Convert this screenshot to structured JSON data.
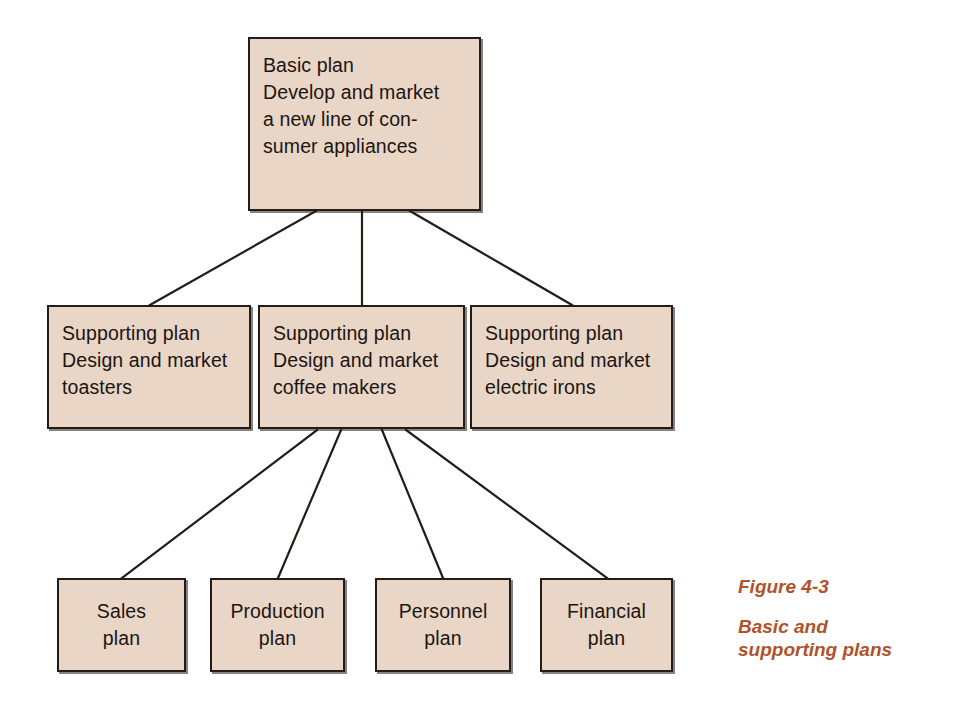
{
  "figure": {
    "background_color": "#ffffff",
    "box_fill_color": "#e9d6c6",
    "box_border_color": "#241c18",
    "connector_color": "#241c18",
    "caption_color": "#b0532a"
  },
  "nodes": {
    "basic": {
      "label": "Basic plan\nDevelop and market\na new line of con-\nsumer appliances"
    },
    "supporting": [
      {
        "label": "Supporting plan\nDesign and market\ntoasters"
      },
      {
        "label": "Supporting plan\nDesign and market\ncoffee makers"
      },
      {
        "label": "Supporting plan\nDesign and market\nelectric irons"
      }
    ],
    "functional": [
      {
        "label": "Sales\nplan"
      },
      {
        "label": "Production\nplan"
      },
      {
        "label": "Personnel\nplan"
      },
      {
        "label": "Financial\nplan"
      }
    ]
  },
  "caption": {
    "number": "Figure 4-3",
    "title": "Basic and\nsupporting plans"
  }
}
